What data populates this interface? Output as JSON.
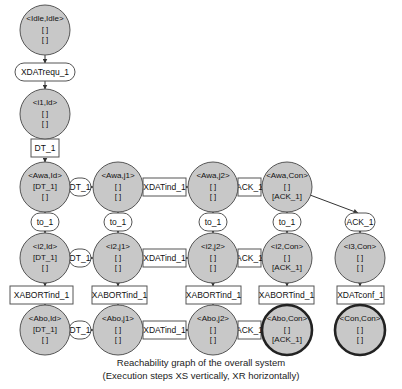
{
  "caption": {
    "line1": "Reachability graph of the overall system",
    "line2": "(Execution steps XS vertically, XR horizontally)"
  },
  "states": {
    "idle_idle": {
      "name": "<Idle,Idle>",
      "l2": "[ ]",
      "l3": "[ ]"
    },
    "i1_id": {
      "name": "<i1,Id>",
      "l2": "[ ]",
      "l3": "[ ]"
    },
    "awa_id": {
      "name": "<Awa,Id>",
      "l2": "[DT_1]",
      "l3": "[ ]"
    },
    "awa_j1": {
      "name": "<Awa,j1>",
      "l2": "[ ]",
      "l3": "[ ]"
    },
    "awa_j2": {
      "name": "<Awa,j2>",
      "l2": "[ ]",
      "l3": "[ ]"
    },
    "awa_con": {
      "name": "<Awa,Con>",
      "l2": "[ ]",
      "l3": "[ACK_1]"
    },
    "i2_id": {
      "name": "<i2,Id>",
      "l2": "[DT_1]",
      "l3": "[ ]"
    },
    "i2_j1": {
      "name": "<i2,j1>",
      "l2": "[ ]",
      "l3": "[ ]"
    },
    "i2_j2": {
      "name": "<i2,j2>",
      "l2": "[ ]",
      "l3": "[ ]"
    },
    "i2_con": {
      "name": "<i2,Con>",
      "l2": "[ ]",
      "l3": "[ACK_1]"
    },
    "i3_con": {
      "name": "<i3,Con>",
      "l2": "[ ]",
      "l3": "[ ]"
    },
    "abo_id": {
      "name": "<Abo,Id>",
      "l2": "[DT_1]",
      "l3": "[ ]"
    },
    "abo_j1": {
      "name": "<Abo,j1>",
      "l2": "[ ]",
      "l3": "[ ]"
    },
    "abo_j2": {
      "name": "<Abo,j2>",
      "l2": "[ ]",
      "l3": "[ ]"
    },
    "abo_con": {
      "name": "<Abo,Con>",
      "l2": "[ ]",
      "l3": "[ACK_1]"
    },
    "con_con": {
      "name": "<Con,Con>",
      "l2": "[ ]",
      "l3": "[ ]"
    }
  },
  "transitions": {
    "xdatrequ": "XDATrequ_1",
    "dt_v": "DT_1",
    "dt_h1": "DT_1",
    "dt_h2": "DT_1",
    "dt_h3": "DT_1",
    "xdatind_h1": "XDATind_1",
    "xdatind_h2": "XDATind_1",
    "xdatind_h3": "XDATind_1",
    "ack_h1": "ACK_1",
    "ack_h2": "ACK_1",
    "ack_h3": "ACK_1",
    "ack_diag": "ACK_1",
    "to_c1": "to_1",
    "to_c2": "to_1",
    "to_c3": "to_1",
    "to_c4": "to_1",
    "xabort_c1": "XABORTind_1",
    "xabort_c2": "XABORTind_1",
    "xabort_c3": "XABORTind_1",
    "xabort_c4": "XABORTind_1",
    "xdatconf": "XDATconf_1"
  },
  "colors": {
    "state_fill": "#c8c8c8",
    "state_stroke": "#555555",
    "final_state_stroke": "#222222",
    "transition_fill": "#ffffff"
  }
}
